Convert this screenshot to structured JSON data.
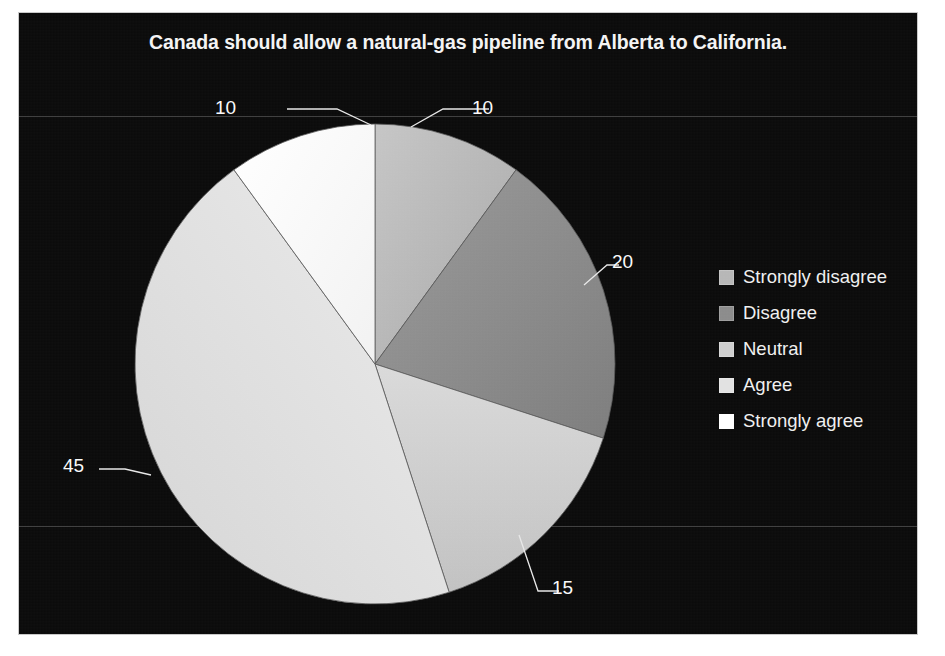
{
  "chart_data": {
    "type": "pie",
    "title": "Canada should allow a natural-gas pipeline from Alberta to California.",
    "categories": [
      "Strongly disagree",
      "Disagree",
      "Neutral",
      "Agree",
      "Strongly agree"
    ],
    "values": [
      10,
      20,
      15,
      45,
      10
    ],
    "value_labels": [
      "10",
      "20",
      "15",
      "45",
      "10"
    ],
    "colors": [
      "#b7b7b7",
      "#8c8c8c",
      "#cfcfcf",
      "#e2e2e2",
      "#ffffff"
    ],
    "total": 100,
    "start_angle_deg": 0,
    "direction": "clockwise",
    "legend_position": "right",
    "grid": true,
    "background_color": "#0b0b0b",
    "text_color": "#f4f4f4",
    "xlabel": "",
    "ylabel": ""
  },
  "title": {
    "text": "Canada should allow a natural-gas pipeline from Alberta to California."
  },
  "legend": {
    "items": [
      {
        "label": "Strongly disagree",
        "color": "#b7b7b7"
      },
      {
        "label": "Disagree",
        "color": "#8c8c8c"
      },
      {
        "label": "Neutral",
        "color": "#cfcfcf"
      },
      {
        "label": "Agree",
        "color": "#e2e2e2"
      },
      {
        "label": "Strongly agree",
        "color": "#ffffff"
      }
    ]
  },
  "labels": {
    "strongly_disagree": "10",
    "disagree": "20",
    "neutral": "15",
    "agree": "45",
    "strongly_agree": "10"
  }
}
